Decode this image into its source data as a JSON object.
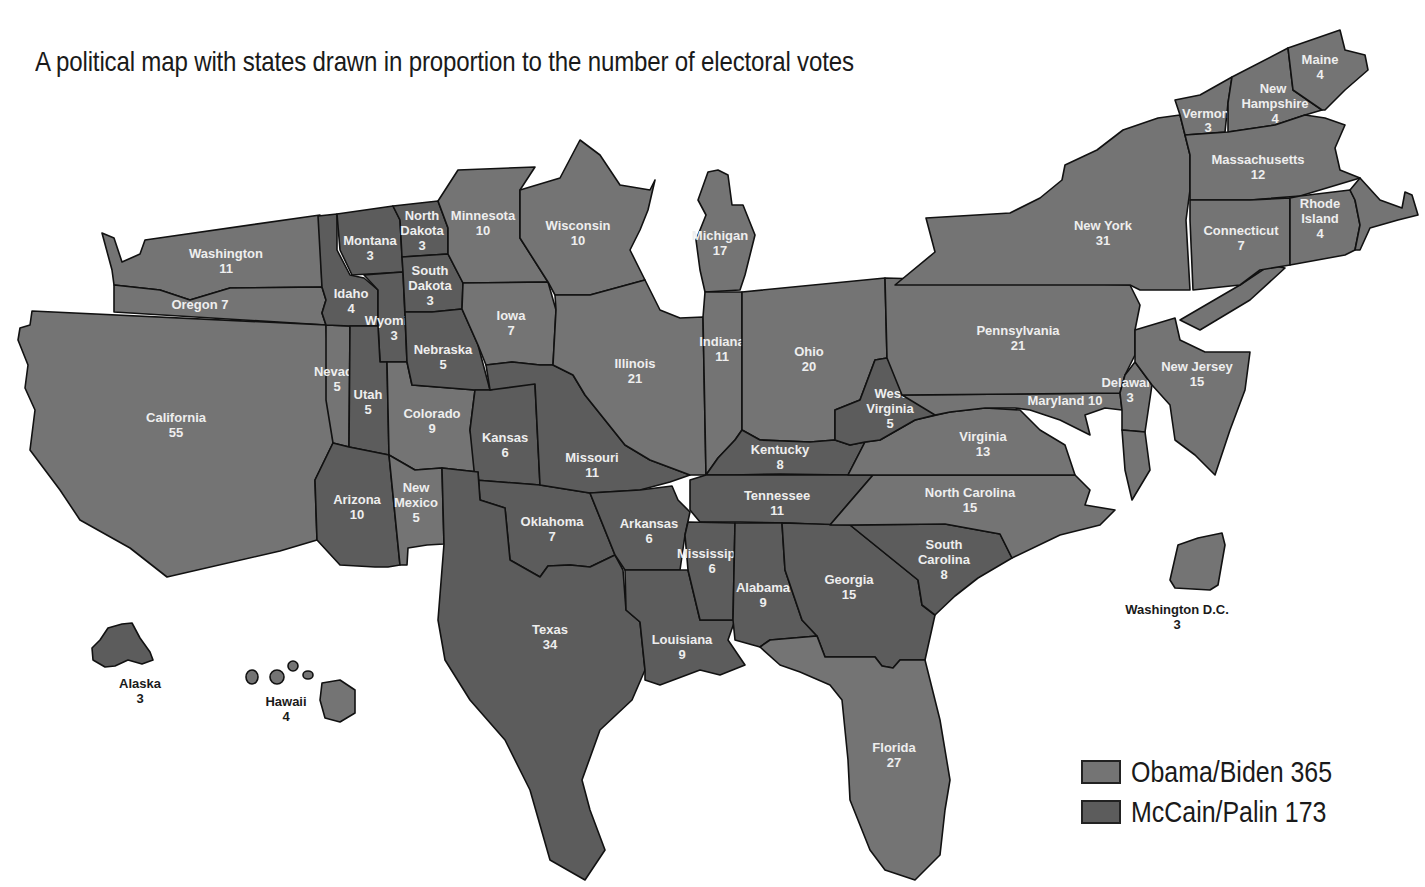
{
  "title": "A political map with states drawn in proportion to the number of electoral votes",
  "colors": {
    "obama": "#747474",
    "mccain": "#5c5c5c",
    "border": "#111111",
    "background": "#ffffff"
  },
  "legend": [
    {
      "key": "obama",
      "label": "Obama/Biden 365",
      "candidate": "Obama/Biden",
      "votes": 365
    },
    {
      "key": "mccain",
      "label": "McCain/Palin 173",
      "candidate": "McCain/Palin",
      "votes": 173
    }
  ],
  "states": {
    "washington": {
      "name": "Washington",
      "votes": "11",
      "winner": "obama"
    },
    "oregon": {
      "name": "Oregon 7",
      "votes": "",
      "winner": "obama"
    },
    "california": {
      "name": "California",
      "votes": "55",
      "winner": "obama"
    },
    "nevada": {
      "name": "Nevada",
      "votes": "5",
      "winner": "obama"
    },
    "idaho": {
      "name": "Idaho",
      "votes": "4",
      "winner": "mccain"
    },
    "montana": {
      "name": "Montana",
      "votes": "3",
      "winner": "mccain"
    },
    "wyoming": {
      "name": "Wyoming",
      "votes": "3",
      "winner": "mccain"
    },
    "utah": {
      "name": "Utah",
      "votes": "5",
      "winner": "mccain"
    },
    "arizona": {
      "name": "Arizona",
      "votes": "10",
      "winner": "mccain"
    },
    "new_mexico": {
      "name_1": "New",
      "name_2": "Mexico",
      "votes": "5",
      "winner": "obama"
    },
    "colorado": {
      "name": "Colorado",
      "votes": "9",
      "winner": "obama"
    },
    "north_dakota": {
      "name_1": "North",
      "name_2": "Dakota",
      "votes": "3",
      "winner": "mccain"
    },
    "south_dakota": {
      "name_1": "South",
      "name_2": "Dakota",
      "votes": "3",
      "winner": "mccain"
    },
    "nebraska": {
      "name": "Nebraska",
      "votes": "5",
      "winner": "mccain"
    },
    "kansas": {
      "name": "Kansas",
      "votes": "6",
      "winner": "mccain"
    },
    "oklahoma": {
      "name": "Oklahoma",
      "votes": "7",
      "winner": "mccain"
    },
    "texas": {
      "name": "Texas",
      "votes": "34",
      "winner": "mccain"
    },
    "minnesota": {
      "name": "Minnesota",
      "votes": "10",
      "winner": "obama"
    },
    "iowa": {
      "name": "Iowa",
      "votes": "7",
      "winner": "obama"
    },
    "missouri": {
      "name": "Missouri",
      "votes": "11",
      "winner": "mccain"
    },
    "arkansas": {
      "name": "Arkansas",
      "votes": "6",
      "winner": "mccain"
    },
    "louisiana": {
      "name": "Louisiana",
      "votes": "9",
      "winner": "mccain"
    },
    "wisconsin": {
      "name": "Wisconsin",
      "votes": "10",
      "winner": "obama"
    },
    "illinois": {
      "name": "Illinois",
      "votes": "21",
      "winner": "obama"
    },
    "michigan": {
      "name": "Michigan",
      "votes": "17",
      "winner": "obama"
    },
    "indiana": {
      "name": "Indiana",
      "votes": "11",
      "winner": "obama"
    },
    "ohio": {
      "name": "Ohio",
      "votes": "20",
      "winner": "obama"
    },
    "kentucky": {
      "name": "Kentucky",
      "votes": "8",
      "winner": "mccain"
    },
    "tennessee": {
      "name": "Tennessee",
      "votes": "11",
      "winner": "mccain"
    },
    "mississippi": {
      "name": "Mississippi",
      "votes": "6",
      "winner": "mccain"
    },
    "alabama": {
      "name": "Alabama",
      "votes": "9",
      "winner": "mccain"
    },
    "georgia": {
      "name": "Georgia",
      "votes": "15",
      "winner": "mccain"
    },
    "florida": {
      "name": "Florida",
      "votes": "27",
      "winner": "obama"
    },
    "south_carolina": {
      "name_1": "South",
      "name_2": "Carolina",
      "votes": "8",
      "winner": "mccain"
    },
    "north_carolina": {
      "name": "North Carolina",
      "votes": "15",
      "winner": "obama"
    },
    "virginia": {
      "name": "Virginia",
      "votes": "13",
      "winner": "obama"
    },
    "west_virginia": {
      "name_1": "West",
      "name_2": "Virginia",
      "votes": "5",
      "winner": "mccain"
    },
    "maryland": {
      "name": "Maryland 10",
      "votes": "",
      "winner": "obama"
    },
    "delaware": {
      "name": "Delaware",
      "votes": "3",
      "winner": "obama"
    },
    "pennsylvania": {
      "name": "Pennsylvania",
      "votes": "21",
      "winner": "obama"
    },
    "new_jersey": {
      "name": "New Jersey",
      "votes": "15",
      "winner": "obama"
    },
    "new_york": {
      "name": "New York",
      "votes": "31",
      "winner": "obama"
    },
    "connecticut": {
      "name": "Connecticut",
      "votes": "7",
      "winner": "obama"
    },
    "rhode_island": {
      "name_1": "Rhode",
      "name_2": "Island",
      "votes": "4",
      "winner": "obama"
    },
    "massachusetts": {
      "name": "Massachusetts",
      "votes": "12",
      "winner": "obama"
    },
    "vermont": {
      "name": "Vermont",
      "votes": "3",
      "winner": "obama"
    },
    "new_hampshire": {
      "name_1": "New",
      "name_2": "Hampshire",
      "votes": "4",
      "winner": "obama"
    },
    "maine": {
      "name": "Maine",
      "votes": "4",
      "winner": "obama"
    },
    "alaska": {
      "name": "Alaska",
      "votes": "3",
      "winner": "mccain"
    },
    "hawaii": {
      "name": "Hawaii",
      "votes": "4",
      "winner": "obama"
    },
    "dc": {
      "name": "Washington D.C.",
      "votes": "3",
      "winner": "obama"
    }
  }
}
